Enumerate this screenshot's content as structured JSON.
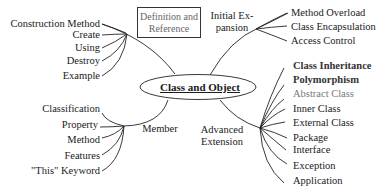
{
  "center": {
    "label": "Class and Object"
  },
  "definition_box": {
    "line1": "Definition and",
    "line2": "Reference"
  },
  "branches": {
    "top_left": {
      "items": [
        "Construction Method",
        "Create",
        "Using",
        "Destroy",
        "Example"
      ]
    },
    "initial_expansion": {
      "label_line1": "Initial Ex-",
      "label_line2": "pansion",
      "items": [
        "Method Overload",
        "Class Encapsulation",
        "Access Control"
      ]
    },
    "member": {
      "label": "Member",
      "items": [
        "Classification",
        "Property",
        "Method",
        "Features",
        "\"This\" Keyword"
      ]
    },
    "advanced_extension": {
      "label_line1": "Advanced",
      "label_line2": "Extension",
      "items": [
        "Class Inheritance",
        "Polymorphism",
        "Abstract Class",
        "Inner Class",
        "External Class",
        "Package",
        "Interface",
        "Exception",
        "Application"
      ]
    }
  }
}
